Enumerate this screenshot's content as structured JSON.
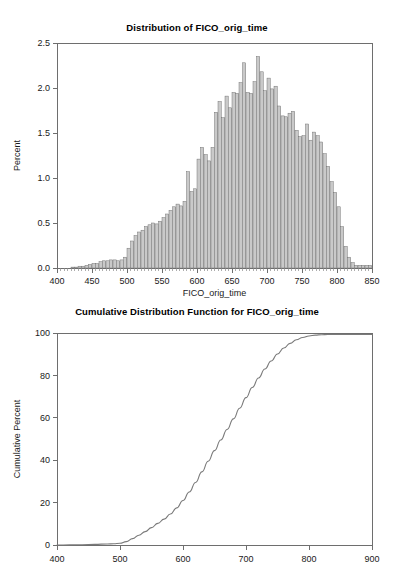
{
  "page": {
    "background": "#ffffff",
    "width": 394,
    "height": 576
  },
  "histogram": {
    "title": "Distribution of FICO_orig_time",
    "xlabel": "FICO_orig_time",
    "ylabel": "Percent",
    "xticks": [
      "400",
      "450",
      "500",
      "550",
      "600",
      "650",
      "700",
      "750",
      "800",
      "850"
    ],
    "yticks": [
      "0.0",
      "0.5",
      "1.0",
      "1.5",
      "2.0",
      "2.5"
    ]
  },
  "cdf": {
    "title": "Cumulative Distribution Function for FICO_orig_time",
    "xlabel": "",
    "ylabel": "Cumulative Percent",
    "xticks": [
      "400",
      "500",
      "600",
      "700",
      "800",
      "900"
    ],
    "yticks": [
      "0",
      "20",
      "40",
      "60",
      "80",
      "100"
    ]
  },
  "colors": {
    "bar_fill": "#c9c9c9",
    "bar_stroke": "#6b6b6b",
    "axis": "#6e6e6e",
    "curve": "#7a7a7a",
    "text": "#1a1a1a",
    "background": "#ffffff"
  },
  "chart_data": [
    {
      "type": "bar",
      "id": "histogram",
      "title": "Distribution of FICO_orig_time",
      "xlabel": "FICO_orig_time",
      "ylabel": "Percent",
      "xlim": [
        400,
        850
      ],
      "ylim": [
        0.0,
        2.5
      ],
      "grid": false,
      "legend": false,
      "bin_width": 5,
      "bin_starts": [
        420,
        425,
        430,
        435,
        440,
        445,
        450,
        455,
        460,
        465,
        470,
        475,
        480,
        485,
        490,
        495,
        500,
        505,
        510,
        515,
        520,
        525,
        530,
        535,
        540,
        545,
        550,
        555,
        560,
        565,
        570,
        575,
        580,
        585,
        590,
        595,
        600,
        605,
        610,
        615,
        620,
        625,
        630,
        635,
        640,
        645,
        650,
        655,
        660,
        665,
        670,
        675,
        680,
        685,
        690,
        695,
        700,
        705,
        710,
        715,
        720,
        725,
        730,
        735,
        740,
        745,
        750,
        755,
        760,
        765,
        770,
        775,
        780,
        785,
        790,
        795,
        800,
        805,
        810,
        815,
        820,
        825,
        830,
        835,
        840,
        845
      ],
      "values": [
        0.01,
        0.01,
        0.02,
        0.02,
        0.03,
        0.04,
        0.05,
        0.05,
        0.07,
        0.08,
        0.08,
        0.09,
        0.09,
        0.08,
        0.09,
        0.12,
        0.22,
        0.3,
        0.36,
        0.4,
        0.42,
        0.46,
        0.48,
        0.5,
        0.49,
        0.52,
        0.56,
        0.6,
        0.64,
        0.68,
        0.71,
        0.69,
        0.74,
        1.07,
        0.85,
        0.88,
        1.21,
        1.34,
        1.26,
        1.19,
        1.34,
        1.73,
        1.85,
        1.67,
        1.91,
        1.78,
        1.95,
        1.94,
        2.06,
        2.28,
        1.95,
        1.94,
        2.07,
        2.35,
        2.18,
        1.97,
        2.11,
        1.99,
        2.02,
        1.8,
        1.69,
        1.68,
        1.72,
        1.74,
        1.53,
        1.46,
        1.47,
        1.6,
        1.42,
        1.51,
        1.47,
        1.4,
        1.27,
        1.13,
        0.96,
        0.84,
        0.68,
        0.46,
        0.24,
        0.12,
        0.06,
        0.03,
        0.03,
        0.03,
        0.03,
        0.03
      ]
    },
    {
      "type": "line",
      "id": "cdf",
      "title": "Cumulative Distribution Function for FICO_orig_time",
      "xlabel": "",
      "ylabel": "Cumulative Percent",
      "xlim": [
        400,
        900
      ],
      "ylim": [
        0,
        100
      ],
      "grid": false,
      "legend": false,
      "x": [
        400,
        420,
        440,
        460,
        480,
        490,
        500,
        510,
        520,
        530,
        540,
        550,
        560,
        570,
        580,
        590,
        600,
        610,
        620,
        630,
        640,
        650,
        660,
        670,
        680,
        690,
        700,
        710,
        720,
        730,
        740,
        750,
        760,
        770,
        780,
        790,
        800,
        810,
        820,
        830,
        840,
        860,
        880,
        900
      ],
      "y": [
        0.0,
        0.05,
        0.15,
        0.3,
        0.5,
        0.6,
        0.8,
        1.6,
        3.0,
        4.6,
        6.3,
        8.2,
        10.2,
        12.2,
        14.6,
        17.5,
        21.0,
        25.0,
        29.5,
        34.5,
        39.5,
        44.5,
        49.5,
        54.5,
        59.5,
        64.5,
        69.5,
        74.3,
        78.8,
        83.0,
        86.8,
        90.1,
        92.9,
        95.1,
        96.8,
        97.9,
        98.6,
        99.0,
        99.2,
        99.3,
        99.3,
        99.3,
        99.3,
        99.3
      ]
    }
  ]
}
